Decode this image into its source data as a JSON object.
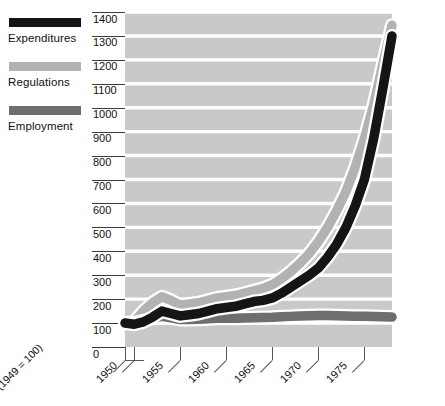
{
  "legend": {
    "items": [
      {
        "label": "Expenditures",
        "color": "#151515",
        "name": "legend-item-expenditures"
      },
      {
        "label": "Regulations",
        "color": "#b2b2b2",
        "name": "legend-item-regulations"
      },
      {
        "label": "Employment",
        "color": "#6e6e6e",
        "name": "legend-item-employment"
      }
    ]
  },
  "chart_data": {
    "type": "line",
    "title": "",
    "subtitle": "",
    "xlabel": "",
    "ylabel": "",
    "index_note": "(1949 = 100)",
    "grid": true,
    "legend_position": "left-outside",
    "xlim": [
      1949,
      1978
    ],
    "ylim": [
      0,
      1400
    ],
    "yticks": [
      0,
      100,
      200,
      300,
      400,
      500,
      600,
      700,
      800,
      900,
      1000,
      1100,
      1200,
      1300,
      1400
    ],
    "ytick_labels": [
      "0",
      "100",
      "200",
      "300",
      "400",
      "500",
      "600",
      "700",
      "800",
      "900",
      "1000",
      "1100",
      "1200",
      "1300",
      "1400"
    ],
    "xticks": [
      1950,
      1955,
      1960,
      1965,
      1970,
      1975
    ],
    "xtick_labels": [
      "1950",
      "1955",
      "1960",
      "1965",
      "1970",
      "1975"
    ],
    "x": [
      1949,
      1950,
      1951,
      1952,
      1953,
      1954,
      1955,
      1956,
      1957,
      1958,
      1959,
      1960,
      1961,
      1962,
      1963,
      1964,
      1965,
      1966,
      1967,
      1968,
      1969,
      1970,
      1971,
      1972,
      1973,
      1974,
      1975,
      1976,
      1977,
      1978
    ],
    "series": [
      {
        "name": "Expenditures",
        "color": "#151515",
        "values": [
          100,
          95,
          105,
          125,
          150,
          140,
          130,
          135,
          140,
          150,
          160,
          165,
          170,
          180,
          190,
          195,
          205,
          225,
          250,
          275,
          300,
          330,
          375,
          430,
          500,
          590,
          700,
          870,
          1080,
          1300
        ]
      },
      {
        "name": "Regulations",
        "color": "#b2b2b2",
        "values": [
          100,
          105,
          150,
          185,
          210,
          195,
          175,
          180,
          185,
          195,
          205,
          210,
          215,
          225,
          235,
          245,
          260,
          285,
          315,
          350,
          390,
          440,
          500,
          570,
          650,
          750,
          870,
          1010,
          1180,
          1345
        ]
      },
      {
        "name": "Employment",
        "color": "#6e6e6e",
        "values": [
          100,
          100,
          110,
          120,
          128,
          122,
          115,
          115,
          116,
          118,
          120,
          120,
          120,
          121,
          122,
          123,
          124,
          126,
          128,
          130,
          131,
          132,
          132,
          131,
          130,
          129,
          128,
          127,
          126,
          125
        ]
      }
    ]
  }
}
